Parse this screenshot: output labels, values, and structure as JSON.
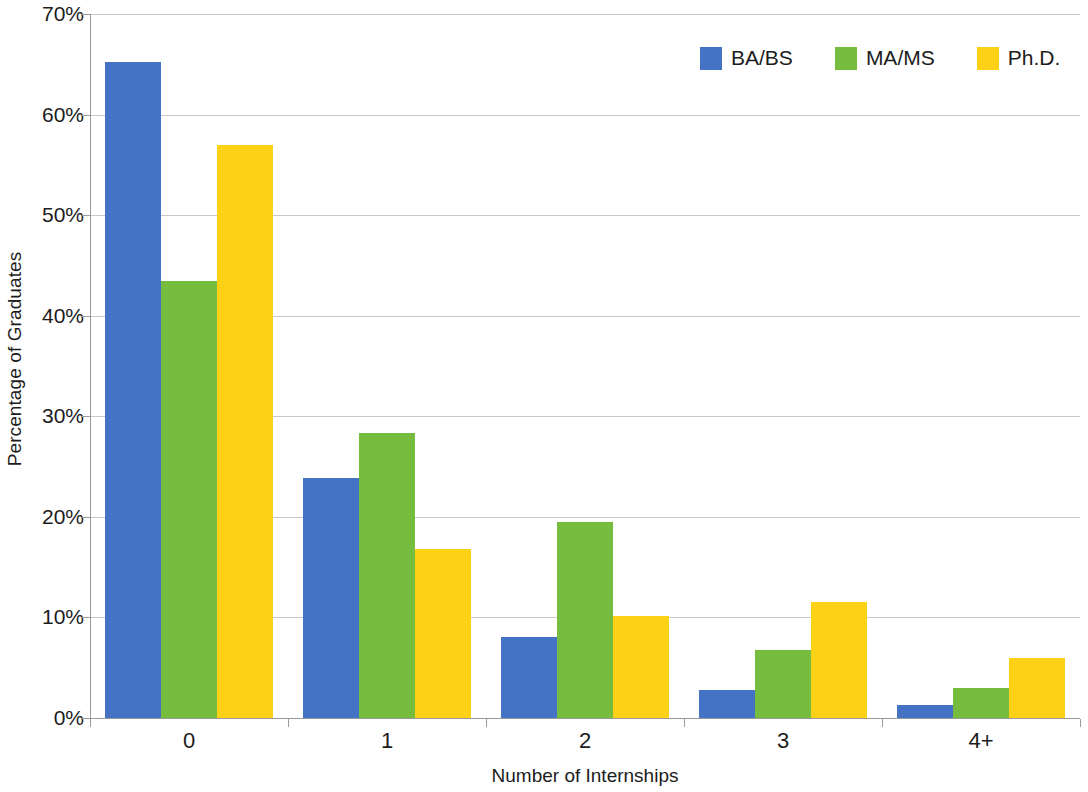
{
  "chart_data": {
    "type": "bar",
    "title": "",
    "xlabel": "Number of Internships",
    "ylabel": "Percentage of Graduates",
    "categories": [
      "0",
      "1",
      "2",
      "3",
      "4+"
    ],
    "series": [
      {
        "name": "BA/BS",
        "color": "#4472C4",
        "values": [
          65.2,
          23.9,
          8.1,
          2.8,
          1.3
        ]
      },
      {
        "name": "MA/MS",
        "color": "#76BC3F",
        "values": [
          43.5,
          28.3,
          19.5,
          6.8,
          3.0
        ]
      },
      {
        "name": "Ph.D.",
        "color": "#FCD116",
        "values": [
          57.0,
          16.8,
          10.1,
          11.5,
          6.0
        ]
      }
    ],
    "ylim": [
      0,
      70
    ],
    "ytick_values": [
      0,
      10,
      20,
      30,
      40,
      50,
      60,
      70
    ],
    "ytick_labels": [
      "0%",
      "10%",
      "20%",
      "30%",
      "40%",
      "50%",
      "60%",
      "70%"
    ],
    "grid": "horizontal",
    "legend_position": "top-right",
    "legend_entries": [
      "BA/BS",
      "MA/MS",
      "Ph.D."
    ],
    "axis_color": "#9a9a9a",
    "gridline_color": "#c8c8c8",
    "background": "#ffffff"
  }
}
